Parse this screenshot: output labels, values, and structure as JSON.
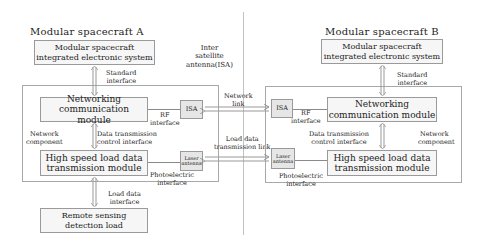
{
  "spacecraft_a": {
    "title": "Modular spacecraft A",
    "integrated_system": {
      "line1": "Modular spacecraft",
      "line2": "integrated electronic system"
    },
    "standard_interface": {
      "line1": "Standard",
      "line2": "interface"
    },
    "networking_module": {
      "line1": "Networking",
      "line2": "communication module"
    },
    "network_component": {
      "line1": "Network",
      "line2": "component"
    },
    "data_control_interface": {
      "line1": "Data transmission",
      "line2": "control interface"
    },
    "high_speed_module": {
      "line1": "High speed load data",
      "line2": "transmission module"
    },
    "load_data_interface": {
      "line1": "Load data",
      "line2": "interface"
    },
    "remote_sensing": {
      "line1": "Remote sensing",
      "line2": "detection load"
    },
    "isa": "ISA",
    "rf_interface": {
      "line1": "RF",
      "line2": "interface"
    },
    "laser_antenna": {
      "line1": "Laser",
      "line2": "antenna"
    },
    "photoelectric_interface": {
      "line1": "Photoelectric",
      "line2": "interface"
    }
  },
  "spacecraft_b": {
    "title": "Modular spacecraft B",
    "integrated_system": {
      "line1": "Modular spacecraft",
      "line2": "integrated electronic system"
    },
    "standard_interface": {
      "line1": "Standard",
      "line2": "interface"
    },
    "networking_module": {
      "line1": "Networking",
      "line2": "communication module"
    },
    "network_component": {
      "line1": "Network",
      "line2": "component"
    },
    "data_control_interface": {
      "line1": "Data transmission",
      "line2": "control interface"
    },
    "high_speed_module": {
      "line1": "High speed load data",
      "line2": "transmission module"
    },
    "isa": "ISA",
    "rf_interface": {
      "line1": "RF",
      "line2": "interface"
    },
    "laser_antenna": {
      "line1": "Laser",
      "line2": "antenna"
    },
    "photoelectric_interface": {
      "line1": "Photoelectric",
      "line2": "interface"
    }
  },
  "links": {
    "isa_label": {
      "line1": "Inter",
      "line2": "satellite",
      "line3": "antenna(ISA)"
    },
    "network_link": {
      "line1": "Network",
      "line2": "link"
    },
    "load_data_link": {
      "line1": "Load data",
      "line2": "transmission link"
    }
  }
}
